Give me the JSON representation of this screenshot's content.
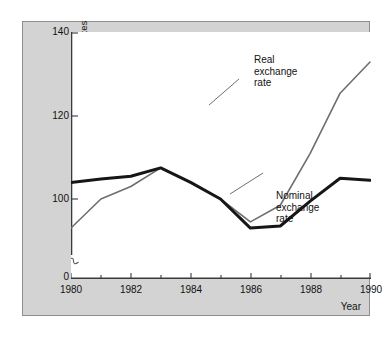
{
  "figure": {
    "background_color": "#d3d3d3",
    "plot_background_color": "#ffffff",
    "border_color": "#8f8f8f"
  },
  "axes": {
    "y_title_line1": "Real and nominal exchange rates",
    "y_title_line2": "(Index number, 1985 = 100)",
    "y_ticks": [
      "0",
      "100",
      "120",
      "140"
    ],
    "x_title": "Year",
    "x_ticks": [
      "1980",
      "1982",
      "1984",
      "1986",
      "1988",
      "1990"
    ],
    "axis_break": "axis-break-symbol"
  },
  "annotations": {
    "real": {
      "line1": "Real",
      "line2": "exchange",
      "line3": "rate"
    },
    "nominal": {
      "line1": "Nominal",
      "line2": "exchange",
      "line3": "rate"
    }
  },
  "chart_data": {
    "type": "line",
    "title": "",
    "xlabel": "Year",
    "ylabel": "Real and nominal exchange rates (Index number, 1985 = 100)",
    "x": [
      1980,
      1981,
      1982,
      1983,
      1984,
      1985,
      1986,
      1987,
      1988,
      1989,
      1990
    ],
    "xlim": [
      1980,
      1990
    ],
    "ylim": [
      88,
      142
    ],
    "y_axis_break_below": 88,
    "y_ticks": [
      0,
      100,
      120,
      140
    ],
    "x_ticks": [
      1980,
      1982,
      1984,
      1986,
      1988,
      1990
    ],
    "x_minor_ticks": [
      1981,
      1983,
      1985,
      1987,
      1989
    ],
    "grid": false,
    "legend": "inline-annotations",
    "series": [
      {
        "name": "Real exchange rate",
        "color": "#6e6e6e",
        "width": 1.6,
        "values": [
          93,
          100,
          103,
          107.5,
          104,
          100,
          94.5,
          98.5,
          111,
          125.5,
          133
        ]
      },
      {
        "name": "Nominal exchange rate",
        "color": "#161616",
        "width": 3.0,
        "values": [
          104,
          104.8,
          105.5,
          107.5,
          104,
          100,
          93,
          93.5,
          99.5,
          105,
          104.5
        ]
      }
    ]
  }
}
